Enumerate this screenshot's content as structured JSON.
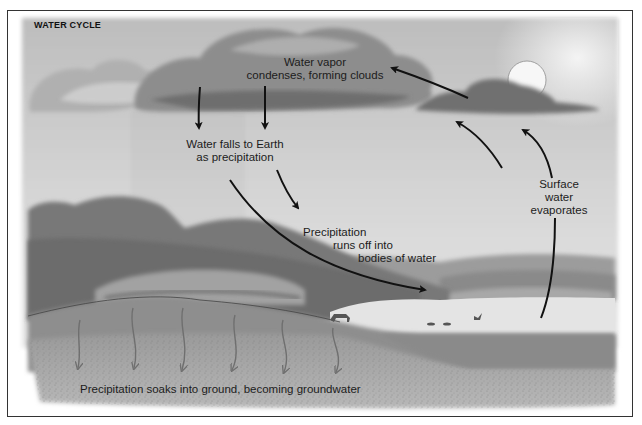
{
  "diagram": {
    "title": "WATER CYCLE",
    "labels": {
      "condense": [
        "Water vapor",
        "condenses, forming clouds"
      ],
      "precip": [
        "Water falls to Earth",
        "as precipitation"
      ],
      "runoff": [
        "Precipitation",
        "runs off into",
        "bodies of water"
      ],
      "evaporate": [
        "Surface",
        "water",
        "evaporates"
      ],
      "groundwater": "Precipitation soaks into ground, becoming groundwater"
    },
    "colors": {
      "frame": "#333333",
      "sky": "#c9c9c9",
      "cloud_dark": "#7a7a7a",
      "hills": "#7d7d7d",
      "ground": "#a3a3a3",
      "water": "#e2e2e2",
      "arrow": "#111111",
      "groundwater_arrow": "#6f6f6f"
    }
  }
}
